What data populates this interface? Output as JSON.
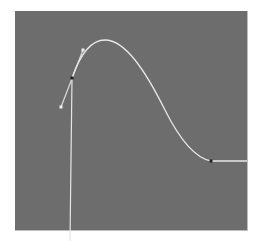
{
  "graph_editor": {
    "panel_color": "#6d6d6d",
    "curve_color": "#e8e8e8",
    "curve": {
      "start_anchor": [
        72,
        78
      ],
      "peak": [
        105,
        40
      ],
      "end_anchor": [
        211,
        161
      ],
      "tail_end": [
        247,
        161
      ]
    },
    "tangent_handle": {
      "upper": [
        83,
        50
      ],
      "lower": [
        61,
        107
      ]
    },
    "time_marker": {
      "x_top": 72,
      "x_bottom": 70,
      "y_top": 78,
      "y_bottom": 241
    }
  }
}
